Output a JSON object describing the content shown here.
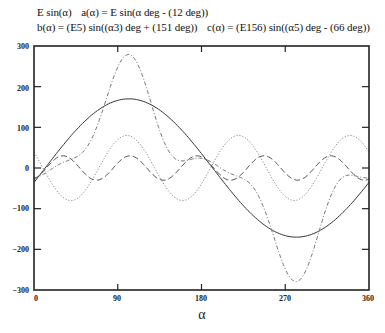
{
  "legend": {
    "line1": [
      "E sin(α)",
      "a(α) = E sin(α deg - (12 deg))"
    ],
    "line2": [
      "b(α) = (E5) sin((α3) deg + (151 deg))",
      "c(α) = (E156) sin((α5) deg - (66 deg))"
    ]
  },
  "axes": {
    "xlabel": "α",
    "x_ticks": [
      "0",
      "90",
      "180",
      "270",
      "360"
    ],
    "y_ticks": [
      "300",
      "200",
      "100",
      "0",
      "−100",
      "−200",
      "−300"
    ]
  },
  "chart_data": {
    "type": "line",
    "title": "",
    "xlabel": "α",
    "ylabel": "",
    "xlim": [
      0,
      360
    ],
    "ylim": [
      -300,
      300
    ],
    "x_ticks": [
      0,
      90,
      180,
      270,
      360
    ],
    "y_ticks": [
      -300,
      -200,
      -100,
      0,
      100,
      200,
      300
    ],
    "grid": false,
    "legend_position": "top (text above plot)",
    "x": [
      0,
      30,
      60,
      90,
      120,
      150,
      180,
      210,
      240,
      270,
      300,
      330,
      360
    ],
    "series": [
      {
        "name": "a(α) = E sin(α deg - (12 deg))",
        "style": "solid",
        "color": "#333333",
        "amplitude": 170,
        "freq": 1,
        "phase_deg": -12,
        "values": [
          -35.3,
          52.5,
          126.3,
          166.3,
          161.7,
          113.8,
          35.3,
          -52.5,
          -126.3,
          -166.3,
          -161.7,
          -113.8,
          -35.3
        ]
      },
      {
        "name": "b(α) = (E5) sin((α3) deg + (151 deg))",
        "style": "dotted",
        "color": "#888888",
        "amplitude": 80,
        "freq": 3,
        "phase_deg": 151,
        "values": [
          38.8,
          -70.0,
          -38.8,
          70.0,
          38.8,
          -70.0,
          -38.8,
          70.0,
          38.8,
          -70.0,
          -38.8,
          70.0,
          38.8
        ]
      },
      {
        "name": "c(α) = (E156) sin((α5) deg - (66 deg))",
        "style": "dashed",
        "color": "#555555",
        "amplitude": 30,
        "freq": 5,
        "phase_deg": -66,
        "values": [
          -27.4,
          29.8,
          -24.3,
          12.2,
          3.1,
          -17.6,
          27.4,
          -29.8,
          24.3,
          -12.2,
          -3.1,
          17.6,
          -27.4
        ]
      },
      {
        "name": "E sin(α) (sum a+b+c)",
        "style": "dash-dot",
        "color": "#777777",
        "components": [
          "a",
          "b",
          "c"
        ],
        "values": [
          -23.9,
          12.3,
          63.2,
          248.5,
          203.6,
          26.2,
          23.9,
          -12.3,
          -63.2,
          -248.5,
          -203.6,
          -26.2,
          -23.9
        ]
      }
    ]
  }
}
